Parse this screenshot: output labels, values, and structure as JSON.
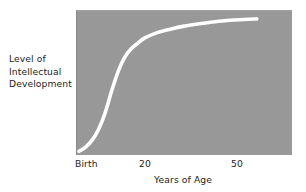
{
  "figure": {
    "background_color": "#ffffff",
    "plot_background_color": "#989898",
    "curve_color": "#ffffff",
    "text_color": "#1d1d1d"
  },
  "y_axis_caption": {
    "line1": "Level of",
    "line2": "Intellectual",
    "line3": "Development"
  },
  "x_axis": {
    "title": "Years of Age",
    "ticks": [
      {
        "label": "Birth"
      },
      {
        "label": "20"
      },
      {
        "label": "50"
      }
    ]
  },
  "chart_data": {
    "type": "line",
    "title": "",
    "subtitle": "",
    "xlabel": "Years of Age",
    "ylabel": "Level of Intellectual Development",
    "xtick_labels": [
      "Birth",
      "20",
      "50"
    ],
    "xtick_values": [
      0,
      20,
      50
    ],
    "ytick_labels": [],
    "xlim": [
      0,
      65
    ],
    "ylim": [
      0,
      1
    ],
    "grid": false,
    "legend": null,
    "legend_position": "none",
    "annotations": [],
    "series": [
      {
        "name": "Intellectual development",
        "color": "#ffffff",
        "linewidth": 3.6,
        "x": [
          0,
          2,
          4,
          6,
          8,
          10,
          12,
          14,
          16,
          18,
          20,
          24,
          28,
          32,
          36,
          40,
          45,
          50,
          54
        ],
        "y": [
          0.02,
          0.05,
          0.1,
          0.18,
          0.3,
          0.46,
          0.6,
          0.7,
          0.76,
          0.8,
          0.835,
          0.875,
          0.9,
          0.92,
          0.935,
          0.948,
          0.96,
          0.968,
          0.972
        ]
      }
    ]
  }
}
